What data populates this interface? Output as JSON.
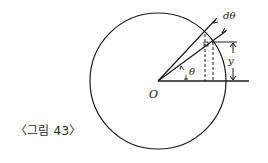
{
  "figure": {
    "caption": "〈그림 43〉",
    "labels": {
      "origin": "O",
      "angle": "θ",
      "d_angle": "dθ",
      "height": "y"
    }
  },
  "colors": {
    "stroke": "#1a1a1a",
    "background": "#ffffff"
  }
}
